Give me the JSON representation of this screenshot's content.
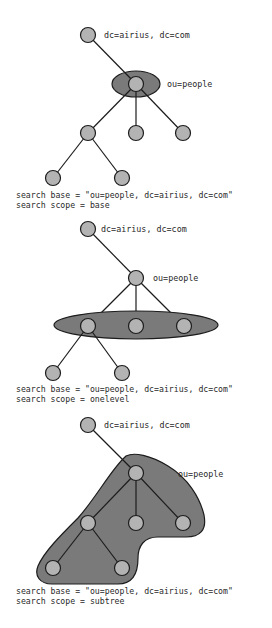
{
  "diagrams": [
    {
      "id": "base",
      "root_label": "dc=airius, dc=com",
      "base_label": "ou=people",
      "caption_line1": "search base = \"ou=people, dc=airius, dc=com\"",
      "caption_line2": "search scope = base",
      "highlight": "ellipse around ou=people node"
    },
    {
      "id": "onelevel",
      "root_label": "dc=airius, dc=com",
      "base_label": "ou=people",
      "caption_line1": "search base = \"ou=people, dc=airius, dc=com\"",
      "caption_line2": "search scope = onelevel",
      "highlight": "ellipse around the three immediate children of ou=people"
    },
    {
      "id": "subtree",
      "root_label": "dc=airius, dc=com",
      "base_label": "ou=people",
      "caption_line1": "search base = \"ou=people, dc=airius, dc=com\"",
      "caption_line2": "search scope = subtree",
      "highlight": "blob around ou=people and all descendants"
    }
  ],
  "colors": {
    "node_fill": "#b3b3b3",
    "scope_fill": "#7a7a7a",
    "stroke": "#1c1c1c",
    "text": "#2a2a2a"
  }
}
